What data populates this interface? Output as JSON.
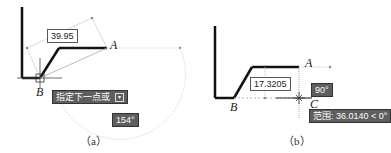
{
  "panel_a": {
    "caption": "（a）",
    "point_a": "A",
    "point_b": "B",
    "dimension_value": "39.95",
    "prompt_tooltip": "指定下一点或",
    "prompt_icon": "dropdown-arrow-icon",
    "angle_tooltip": "154°"
  },
  "panel_b": {
    "caption": "（b）",
    "point_a": "A",
    "point_b": "B",
    "point_c": "C",
    "dimension_value": "17.3205",
    "angle_tooltip": "90°",
    "range_tooltip": "范围: 36.0140 < 0°"
  }
}
